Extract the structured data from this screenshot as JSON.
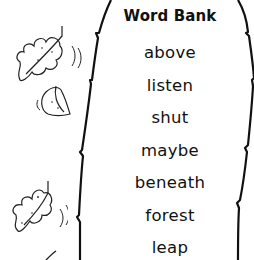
{
  "word_bank": {
    "title": "Word Bank",
    "words": [
      {
        "label": "above"
      },
      {
        "label": "listen"
      },
      {
        "label": "shut"
      },
      {
        "label": "maybe"
      },
      {
        "label": "beneath"
      },
      {
        "label": "forest"
      },
      {
        "label": "leap"
      }
    ]
  },
  "decorations": {
    "icons": [
      "oak-leaf-icon",
      "round-leaf-icon",
      "oak-leaf-icon",
      "leaf-stem-icon"
    ]
  },
  "colors": {
    "ink": "#111111",
    "background": "#ffffff"
  }
}
